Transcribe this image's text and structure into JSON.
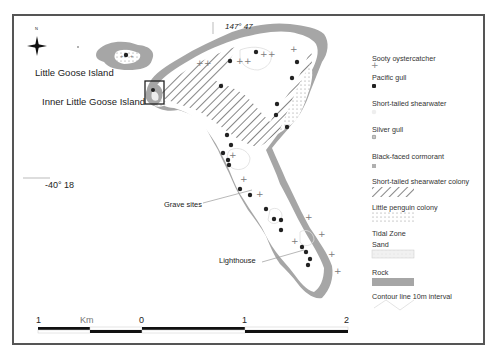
{
  "map": {
    "place_labels": {
      "little_goose_island": "Little Goose Island",
      "inner_little_goose_island": "Inner Little Goose Island",
      "grave_sites": "Grave sites",
      "lighthouse": "Lighthouse"
    },
    "coordinates": {
      "longitude": "147° 47",
      "latitude": "-40° 18"
    },
    "north_arrow_label": "N"
  },
  "legend": {
    "items": [
      {
        "label": "Sooty oystercatcher",
        "symbol": "cross-plus",
        "color": "#8a8a8a"
      },
      {
        "label": "Pacific gull",
        "symbol": "dark-circle",
        "color": "#222222"
      },
      {
        "label": "Short-tailed shearwater",
        "symbol": "light-circle",
        "color": "#e4e4e4"
      },
      {
        "label": "Silver gull",
        "symbol": "diamond-cross",
        "color": "#777777"
      },
      {
        "label": "Black-faced cormorant",
        "symbol": "small-square",
        "color": "#b0b0b0"
      },
      {
        "label": "Short-tailed shearwater colony",
        "symbol": "diagonal-hatch",
        "color": "#666666"
      },
      {
        "label": "Little penguin colony",
        "symbol": "dot-stipple",
        "color": "#999999"
      }
    ],
    "tidal_zone_heading": "Tidal Zone",
    "sand_label": "Sand",
    "sand_color": "#eeeeee",
    "rock_label": "Rock",
    "rock_color": "#a6a6a6",
    "contour_label": "Contour line 10m interval"
  },
  "scale_bar": {
    "ticks": [
      "1",
      "0",
      "1",
      "2"
    ],
    "unit": "Km"
  }
}
